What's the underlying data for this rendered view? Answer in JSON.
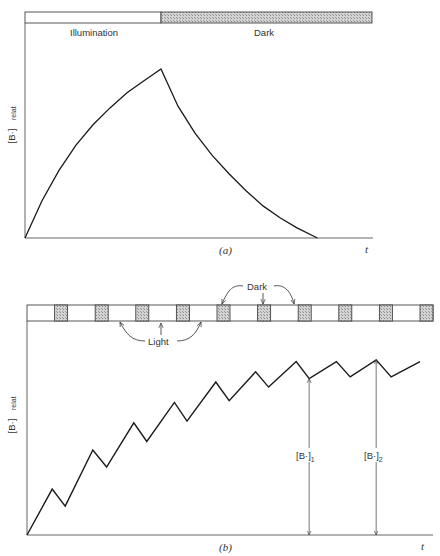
{
  "figure": {
    "panel_a": {
      "caption": "(a)",
      "bar_labels": {
        "light": "Illumination",
        "dark": "Dark"
      },
      "y_label_main": "[B·]",
      "y_label_sub": "relat",
      "x_label": "t"
    },
    "panel_b": {
      "caption": "(b)",
      "annot_dark": "Dark",
      "annot_light": "Light",
      "y_label_main": "[B·]",
      "y_label_sub": "relat",
      "x_label": "t",
      "marker1_main": "[B·]",
      "marker1_sub": "1",
      "marker2_main": "[B·]",
      "marker2_sub": "2"
    },
    "colors": {
      "line": "#1a1a1a",
      "hatch": "#b8b8b8",
      "axis": "#555555"
    }
  },
  "chart_data": [
    {
      "type": "line",
      "title": "(a) Continuous illumination then dark",
      "xlabel": "t",
      "ylabel": "[B·] relat",
      "phases": [
        {
          "name": "Illumination",
          "t_start": 0,
          "t_end": 0.4
        },
        {
          "name": "Dark",
          "t_start": 0.4,
          "t_end": 1.0
        }
      ],
      "series": [
        {
          "name": "[B·] relat",
          "x": [
            0,
            0.05,
            0.1,
            0.15,
            0.2,
            0.25,
            0.3,
            0.35,
            0.4,
            0.45,
            0.5,
            0.55,
            0.6,
            0.65,
            0.7,
            0.75,
            0.8,
            0.86
          ],
          "y": [
            0,
            0.22,
            0.4,
            0.55,
            0.67,
            0.77,
            0.86,
            0.93,
            1.0,
            0.78,
            0.62,
            0.49,
            0.38,
            0.28,
            0.19,
            0.12,
            0.06,
            0.0
          ]
        }
      ],
      "xlim": [
        0,
        1
      ],
      "ylim": [
        0,
        1.1
      ],
      "grid": false
    },
    {
      "type": "line",
      "title": "(b) Intermittent illumination (light/dark cycles)",
      "xlabel": "t",
      "ylabel": "[B·] relat",
      "cycle": {
        "light_fraction": 0.68,
        "dark_fraction": 0.32,
        "cycles": 10
      },
      "series": [
        {
          "name": "[B·] relat",
          "x": [
            0,
            0.62,
            0.94,
            1.62,
            1.96,
            2.63,
            2.95,
            3.63,
            3.94,
            4.65,
            4.98,
            5.63,
            5.95,
            6.63,
            6.95,
            7.62,
            7.96,
            8.6,
            8.97,
            9.68
          ],
          "y": [
            0,
            0.27,
            0.17,
            0.5,
            0.4,
            0.66,
            0.55,
            0.78,
            0.67,
            0.9,
            0.79,
            0.96,
            0.87,
            1.02,
            0.92,
            1.02,
            0.93,
            1.03,
            0.93,
            1.02
          ]
        }
      ],
      "annotations": [
        {
          "label": "[B·]1",
          "x": 6.95,
          "y": 0.92,
          "meaning": "level at end of dark period"
        },
        {
          "label": "[B·]2",
          "x": 8.6,
          "y": 1.03,
          "meaning": "level at end of light period"
        }
      ],
      "xlim": [
        0,
        10
      ],
      "ylim": [
        0,
        1.2
      ],
      "grid": false
    }
  ]
}
